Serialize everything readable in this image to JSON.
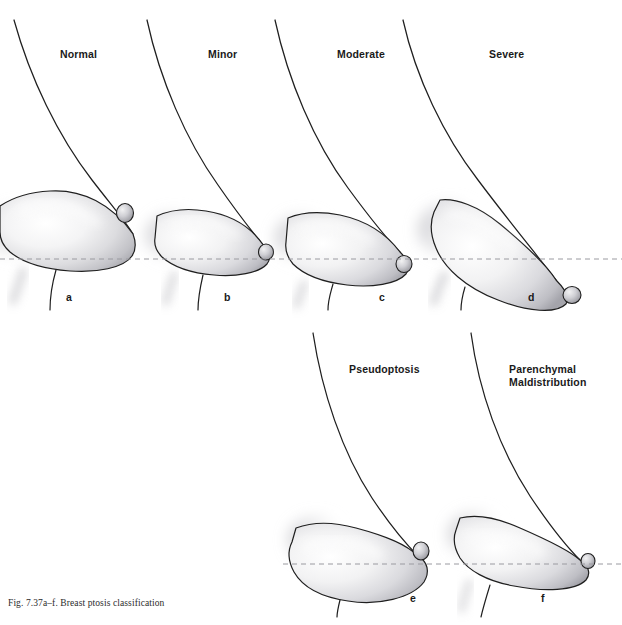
{
  "figure": {
    "caption": "Fig. 7.37a–f. Breast ptosis classification",
    "width": 622,
    "height": 625,
    "background_color": "#ffffff",
    "outline_color": "#1f1f1f",
    "fold_line_color": "#9a9aa0",
    "shading_light": "#fdfdfd",
    "shading_mid": "#d8d8da",
    "shading_dark": "#8d8d92"
  },
  "fold_lines": [
    {
      "name": "upper-inframammary-fold-line",
      "y": 259,
      "x1": 0,
      "x2": 622
    },
    {
      "name": "lower-inframammary-fold-line",
      "y": 564,
      "x1": 283,
      "x2": 622
    }
  ],
  "panels": [
    {
      "letter": "a",
      "title": "Normal",
      "title_x": 60,
      "title_y": 48,
      "letter_x": 66,
      "letter_y": 291,
      "nipple_relation": "above fold"
    },
    {
      "letter": "b",
      "title": "Minor",
      "title_x": 208,
      "title_y": 48,
      "letter_x": 224,
      "letter_y": 291,
      "nipple_relation": "at fold"
    },
    {
      "letter": "c",
      "title": "Moderate",
      "title_x": 337,
      "title_y": 48,
      "letter_x": 379,
      "letter_y": 291,
      "nipple_relation": "just below fold"
    },
    {
      "letter": "d",
      "title": "Severe",
      "title_x": 489,
      "title_y": 48,
      "letter_x": 528,
      "letter_y": 291,
      "nipple_relation": "well below fold, pointing down"
    },
    {
      "letter": "e",
      "title": "Pseudoptosis",
      "title_x": 349,
      "title_y": 363,
      "letter_x": 410,
      "letter_y": 592,
      "nipple_relation": "at or above fold, tissue below"
    },
    {
      "letter": "f",
      "title": "Parenchymal\nMaldistribution",
      "title_x": 509,
      "title_y": 363,
      "letter_x": 541,
      "letter_y": 592,
      "nipple_relation": "at fold, upper pole deficient"
    }
  ]
}
